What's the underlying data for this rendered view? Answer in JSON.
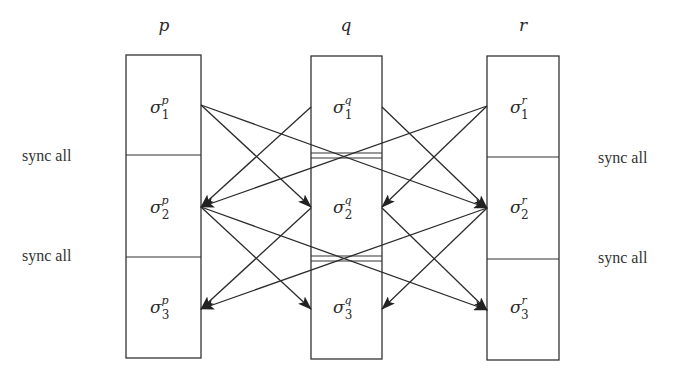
{
  "diagram": {
    "type": "process-synchronization",
    "processes": [
      {
        "id": "p",
        "label": "p",
        "states": [
          {
            "base": "σ",
            "sup": "p",
            "sub": "1"
          },
          {
            "base": "σ",
            "sup": "p",
            "sub": "2"
          },
          {
            "base": "σ",
            "sup": "p",
            "sub": "3"
          }
        ]
      },
      {
        "id": "q",
        "label": "q",
        "states": [
          {
            "base": "σ",
            "sup": "q",
            "sub": "1"
          },
          {
            "base": "σ",
            "sup": "q",
            "sub": "2"
          },
          {
            "base": "σ",
            "sup": "q",
            "sub": "3"
          }
        ]
      },
      {
        "id": "r",
        "label": "r",
        "states": [
          {
            "base": "σ",
            "sup": "r",
            "sub": "1"
          },
          {
            "base": "σ",
            "sup": "r",
            "sub": "2"
          },
          {
            "base": "σ",
            "sup": "r",
            "sub": "3"
          }
        ]
      }
    ],
    "sync_labels": {
      "left": [
        "sync all",
        "sync all"
      ],
      "right": [
        "sync all",
        "sync all"
      ]
    },
    "edges": [
      {
        "from": "p.1",
        "to": "q.2"
      },
      {
        "from": "p.1",
        "to": "r.2"
      },
      {
        "from": "q.1",
        "to": "p.2"
      },
      {
        "from": "q.1",
        "to": "r.2"
      },
      {
        "from": "r.1",
        "to": "p.2"
      },
      {
        "from": "r.1",
        "to": "q.2"
      },
      {
        "from": "p.2",
        "to": "q.3"
      },
      {
        "from": "p.2",
        "to": "r.3"
      },
      {
        "from": "q.2",
        "to": "p.3"
      },
      {
        "from": "q.2",
        "to": "r.3"
      },
      {
        "from": "r.2",
        "to": "p.3"
      },
      {
        "from": "r.2",
        "to": "q.3"
      }
    ],
    "colors": {
      "stroke": "#333333",
      "text": "#2a2a2a",
      "background": "#ffffff"
    }
  }
}
